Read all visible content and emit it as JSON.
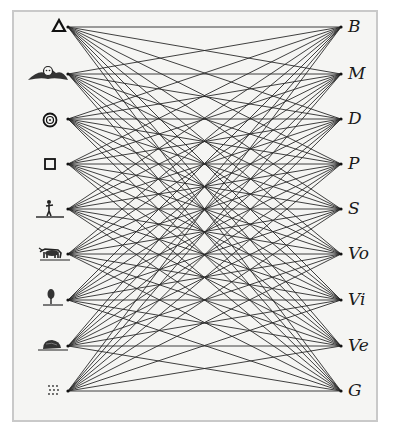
{
  "diagram": {
    "type": "complete-bipartite-graph",
    "left_nodes": [
      {
        "id": "triangle",
        "icon": "triangle-icon",
        "y": 27
      },
      {
        "id": "winged-head",
        "icon": "winged-cherub-icon",
        "y": 74
      },
      {
        "id": "concentric-circles",
        "icon": "concentric-circles-icon",
        "y": 119
      },
      {
        "id": "square",
        "icon": "square-icon",
        "y": 164
      },
      {
        "id": "human-figure",
        "icon": "human-figure-icon",
        "y": 209
      },
      {
        "id": "animal",
        "icon": "animal-icon",
        "y": 254
      },
      {
        "id": "tree",
        "icon": "tree-icon",
        "y": 300
      },
      {
        "id": "rock",
        "icon": "rock-icon",
        "y": 346
      },
      {
        "id": "dots",
        "icon": "dots-grid-icon",
        "y": 391
      }
    ],
    "right_nodes": [
      {
        "label": "B",
        "y": 27
      },
      {
        "label": "M",
        "y": 74
      },
      {
        "label": "D",
        "y": 119
      },
      {
        "label": "P",
        "y": 164
      },
      {
        "label": "S",
        "y": 209
      },
      {
        "label": "Vo",
        "y": 254
      },
      {
        "label": "Vi",
        "y": 300
      },
      {
        "label": "Ve",
        "y": 346
      },
      {
        "label": "G",
        "y": 391
      }
    ],
    "left_x": 68,
    "right_x": 341,
    "edge_color": "#2a2a2a",
    "background_color": "#f5f5f3",
    "frame_color": "#c9c9c9"
  }
}
